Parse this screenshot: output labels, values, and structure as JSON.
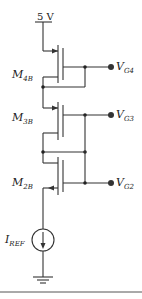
{
  "diagram": {
    "type": "circuit-schematic",
    "supply": {
      "label": "5 V"
    },
    "transistors": [
      {
        "id": "M4B",
        "name": "M",
        "subscript": "4B",
        "gate_output": {
          "name": "V",
          "subscript": "G4"
        }
      },
      {
        "id": "M3B",
        "name": "M",
        "subscript": "3B",
        "gate_output": {
          "name": "V",
          "subscript": "G3"
        }
      },
      {
        "id": "M2B",
        "name": "M",
        "subscript": "2B",
        "gate_output": {
          "name": "V",
          "subscript": "G2"
        }
      }
    ],
    "current_source": {
      "name": "I",
      "subscript": "REF"
    },
    "ground": "ground-symbol"
  }
}
